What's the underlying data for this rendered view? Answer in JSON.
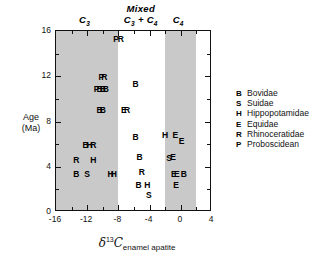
{
  "chart_data": {
    "type": "scatter",
    "title": "",
    "xlabel": "δ¹³C enamel apatite",
    "ylabel": "Age (Ma)",
    "xlim": [
      -16,
      4
    ],
    "ylim": [
      16,
      0
    ],
    "y_inverted": true,
    "grid": false,
    "legend_position": "right",
    "xticks": [
      -16,
      -12,
      -8,
      -4,
      0,
      4
    ],
    "xtick_labels": [
      "-16",
      "-12",
      "-8",
      "-4",
      "0",
      "4"
    ],
    "xminor_ticks": [
      -14,
      -10,
      -6,
      -2,
      2
    ],
    "yticks": [
      0,
      4,
      8,
      12,
      16
    ],
    "ytick_labels": [
      "0",
      "4",
      "8",
      "12",
      "16"
    ],
    "yminor_ticks": [
      2,
      6,
      10,
      14
    ],
    "bands": [
      {
        "name": "C3",
        "x0": -16,
        "x1": -8,
        "color": "#c9c9c9"
      },
      {
        "name": "C4",
        "x0": -2,
        "x1": 2,
        "color": "#c9c9c9"
      }
    ],
    "zone_headers": [
      {
        "id": "c3",
        "line1": "C",
        "sub1": "3",
        "line2": "",
        "x": -12.2
      },
      {
        "id": "mixed",
        "line1": "Mixed",
        "sub1": "",
        "line2": "C3 + C4",
        "x": -5.0
      },
      {
        "id": "c4",
        "line1": "C",
        "sub1": "4",
        "line2": "",
        "x": -0.2
      }
    ],
    "points": [
      {
        "label": "B",
        "x": -13.4,
        "y": 3.4
      },
      {
        "label": "S",
        "x": -12.0,
        "y": 3.4
      },
      {
        "label": "R",
        "x": -13.4,
        "y": 4.6
      },
      {
        "label": "H",
        "x": -11.2,
        "y": 4.6
      },
      {
        "label": "B",
        "x": -12.2,
        "y": 5.9
      },
      {
        "label": "H",
        "x": -11.7,
        "y": 5.9
      },
      {
        "label": "R",
        "x": -11.2,
        "y": 5.9
      },
      {
        "label": "B",
        "x": -10.4,
        "y": 9.0
      },
      {
        "label": "B",
        "x": -10.0,
        "y": 9.0
      },
      {
        "label": "P",
        "x": -10.8,
        "y": 10.9
      },
      {
        "label": "B",
        "x": -10.4,
        "y": 10.9
      },
      {
        "label": "B",
        "x": -10.0,
        "y": 10.9
      },
      {
        "label": "B",
        "x": -9.6,
        "y": 10.9
      },
      {
        "label": "P",
        "x": -10.2,
        "y": 11.9
      },
      {
        "label": "R",
        "x": -9.8,
        "y": 11.9
      },
      {
        "label": "P",
        "x": -8.3,
        "y": 15.3
      },
      {
        "label": "R",
        "x": -7.7,
        "y": 15.3
      },
      {
        "label": "H",
        "x": -9.0,
        "y": 3.4
      },
      {
        "label": "H",
        "x": -8.6,
        "y": 3.4
      },
      {
        "label": "S",
        "x": -4.1,
        "y": 1.5
      },
      {
        "label": "B",
        "x": -5.4,
        "y": 2.4
      },
      {
        "label": "H",
        "x": -4.3,
        "y": 2.4
      },
      {
        "label": "R",
        "x": -5.0,
        "y": 3.5
      },
      {
        "label": "B",
        "x": -5.3,
        "y": 4.9
      },
      {
        "label": "B",
        "x": -5.8,
        "y": 6.6
      },
      {
        "label": "E",
        "x": -7.3,
        "y": 9.0
      },
      {
        "label": "R",
        "x": -6.9,
        "y": 9.0
      },
      {
        "label": "B",
        "x": -5.8,
        "y": 11.3
      },
      {
        "label": "E",
        "x": -0.6,
        "y": 2.4
      },
      {
        "label": "E",
        "x": -0.9,
        "y": 3.4
      },
      {
        "label": "E",
        "x": -0.5,
        "y": 3.4
      },
      {
        "label": "B",
        "x": 0.4,
        "y": 3.4
      },
      {
        "label": "S",
        "x": -1.5,
        "y": 4.8
      },
      {
        "label": "E",
        "x": -1.0,
        "y": 4.9
      },
      {
        "label": "H",
        "x": -2.0,
        "y": 6.8
      },
      {
        "label": "E",
        "x": -0.7,
        "y": 6.8
      },
      {
        "label": "E",
        "x": 0.1,
        "y": 6.3
      }
    ],
    "legend": [
      {
        "key": "B",
        "name": "Bovidae"
      },
      {
        "key": "S",
        "name": "Suidae"
      },
      {
        "key": "H",
        "name": "Hippopotamidae"
      },
      {
        "key": "E",
        "name": "Equidae"
      },
      {
        "key": "R",
        "name": "Rhinoceratidae"
      },
      {
        "key": "P",
        "name": "Proboscidean"
      }
    ]
  },
  "axis_titles": {
    "y_line1": "Age",
    "y_line2": "(Ma)",
    "x_delta": "δ",
    "x_superscript": "13",
    "x_element": "C",
    "x_subscript": "enamel apatite"
  },
  "colors": {
    "band_fill": "#c9c9c9",
    "frame": "#111111",
    "text": "#000000",
    "background": "#ffffff"
  }
}
